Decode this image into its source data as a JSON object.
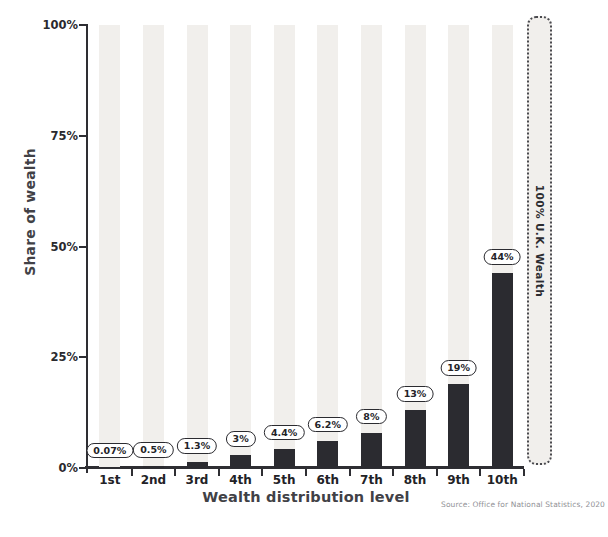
{
  "chart_data": {
    "type": "bar",
    "title": "",
    "categories": [
      "1st",
      "2nd",
      "3rd",
      "4th",
      "5th",
      "6th",
      "7th",
      "8th",
      "9th",
      "10th"
    ],
    "values": [
      0.07,
      0.5,
      1.3,
      3,
      4.4,
      6.2,
      8,
      13,
      19,
      44
    ],
    "value_labels": [
      "0.07%",
      "0.5%",
      "1.3%",
      "3%",
      "4.4%",
      "6.2%",
      "8%",
      "13%",
      "19%",
      "44%"
    ],
    "xlabel": "Wealth distribution level",
    "ylabel": "Share of wealth",
    "ylim": [
      0,
      100
    ],
    "yticks": [
      {
        "label": "0%",
        "value": 0
      },
      {
        "label": "25%",
        "value": 25
      },
      {
        "label": "50%",
        "value": 50
      },
      {
        "label": "75%",
        "value": 75
      },
      {
        "label": "100%",
        "value": 100
      }
    ],
    "grid": false,
    "legend": null,
    "track_bars_to_100": true,
    "annotation_box": {
      "label": "100% U.K. Wealth"
    },
    "source": "Source: Office for National Statistics, 2020",
    "colors": {
      "bar": "#2b2b30",
      "track": "#f1efec",
      "pill_background": "#ffffff",
      "pill_border": "#2b2b30",
      "axis": "#2e2e33",
      "category_text": "#222226",
      "axis_title_text": "#414146",
      "source_text": "#919196",
      "background": "#ffffff"
    }
  }
}
